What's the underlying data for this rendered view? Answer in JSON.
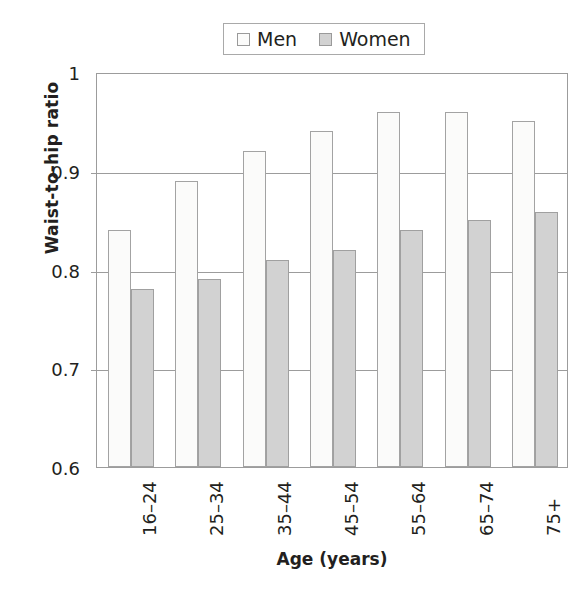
{
  "chart_data": {
    "type": "bar",
    "title": "",
    "xlabel": "Age (years)",
    "ylabel": "Waist-to-hip ratio",
    "categories": [
      "16–24",
      "25–34",
      "35–44",
      "45–54",
      "55–64",
      "65–74",
      "75+"
    ],
    "series": [
      {
        "name": "Men",
        "values": [
          0.84,
          0.89,
          0.92,
          0.94,
          0.96,
          0.96,
          0.95
        ]
      },
      {
        "name": "Women",
        "values": [
          0.78,
          0.79,
          0.81,
          0.82,
          0.84,
          0.85,
          0.858
        ]
      }
    ],
    "ylim": [
      0.6,
      1.0
    ],
    "yticks": [
      "0.6",
      "0.7",
      "0.8",
      "0.9",
      "1"
    ],
    "ytick_values": [
      0.6,
      0.7,
      0.8,
      0.9,
      1.0
    ],
    "grid": true,
    "legend_position": "top-center",
    "colors": {
      "men_fill": "#fbfbfa",
      "women_fill": "#d2d2d2",
      "bar_stroke": "#a3a3a3",
      "axis": "#9c9c9c",
      "text": "#231f20"
    }
  },
  "legend": {
    "entries": [
      {
        "label": "Men"
      },
      {
        "label": "Women"
      }
    ]
  }
}
